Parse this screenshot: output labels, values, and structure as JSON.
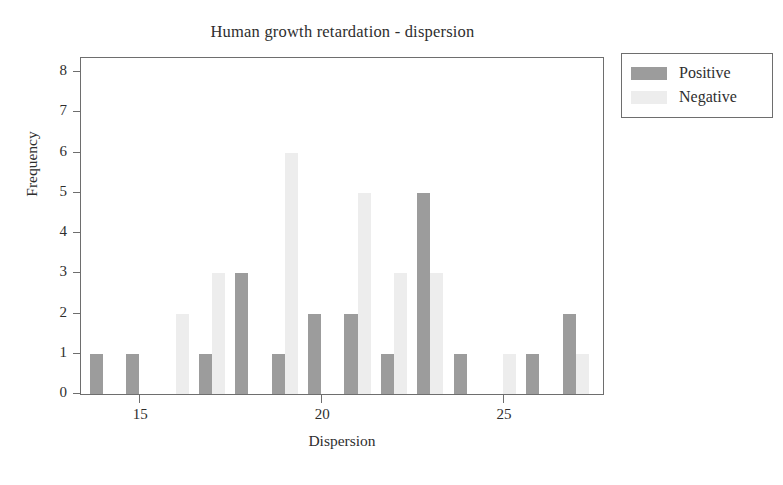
{
  "chart_data": {
    "type": "bar",
    "title": "Human growth retardation - dispersion",
    "xlabel": "Dispersion",
    "ylabel": "Frequency",
    "grid": false,
    "legend_position": "top-right-outside",
    "xlim": [
      13.4,
      27.8
    ],
    "ylim": [
      0,
      8.4
    ],
    "xticks": [
      15,
      20,
      25
    ],
    "xtick_labels": [
      "15",
      "20",
      "25"
    ],
    "yticks": [
      0,
      1,
      2,
      3,
      4,
      5,
      6,
      7,
      8
    ],
    "ytick_labels": [
      "0",
      "1",
      "2",
      "3",
      "4",
      "5",
      "6",
      "7",
      "8"
    ],
    "categories": [
      14,
      15,
      16,
      17,
      18,
      19,
      20,
      21,
      22,
      23,
      24,
      25,
      26,
      27
    ],
    "series": [
      {
        "name": "Positive",
        "color": "#9c9c9c",
        "values": [
          1,
          1,
          0,
          1,
          3,
          1,
          2,
          2,
          1,
          5,
          1,
          0,
          1,
          2
        ]
      },
      {
        "name": "Negative",
        "color": "#ededed",
        "values": [
          0,
          0,
          2,
          3,
          0,
          6,
          0,
          5,
          3,
          3,
          0,
          1,
          0,
          1
        ]
      }
    ]
  },
  "legend": {
    "items": [
      {
        "label": "Positive",
        "swatch": "positive"
      },
      {
        "label": "Negative",
        "swatch": "negative"
      }
    ]
  },
  "colors": {
    "positive": "#9c9c9c",
    "negative": "#ededed",
    "axis": "#6e6e6e",
    "text": "#2e2e2e",
    "background": "#ffffff"
  }
}
